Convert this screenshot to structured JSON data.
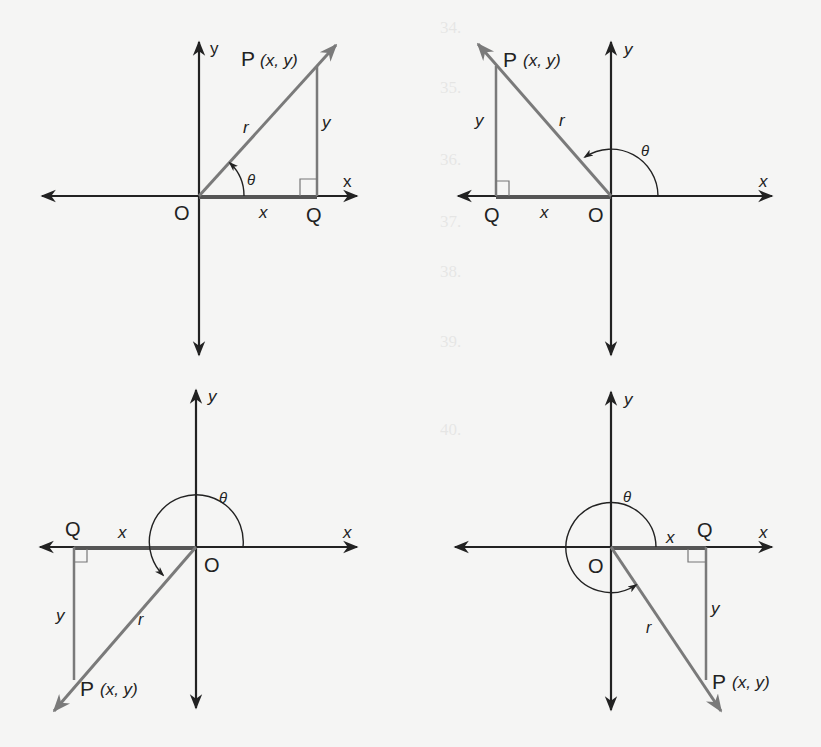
{
  "figure": {
    "colors": {
      "background": "#f5f5f4",
      "axis": "#222222",
      "ray": "#7a7a7a",
      "label": "#222222"
    },
    "panels": [
      {
        "id": "quadrant-1",
        "labels": {
          "point": "P",
          "point_coords": "(x, y)",
          "origin": "O",
          "foot": "Q",
          "x_axis": "x",
          "y_axis": "y",
          "x_seg": "x",
          "y_seg": "y",
          "radius": "r",
          "angle": "θ"
        }
      },
      {
        "id": "quadrant-2",
        "labels": {
          "point": "P",
          "point_coords": "(x, y)",
          "origin": "O",
          "foot": "Q",
          "x_axis": "x",
          "y_axis": "y",
          "x_seg": "x",
          "y_seg": "y",
          "radius": "r",
          "angle": "θ"
        }
      },
      {
        "id": "quadrant-3",
        "labels": {
          "point": "P",
          "point_coords": "(x, y)",
          "origin": "O",
          "foot": "Q",
          "x_axis": "x",
          "y_axis": "y",
          "x_seg": "x",
          "y_seg": "y",
          "radius": "r",
          "angle": "θ"
        }
      },
      {
        "id": "quadrant-4",
        "labels": {
          "point": "P",
          "point_coords": "(x, y)",
          "origin": "O",
          "foot": "Q",
          "x_axis": "x",
          "y_axis": "y",
          "x_seg": "x",
          "y_seg": "y",
          "radius": "r",
          "angle": "θ"
        }
      }
    ]
  },
  "bleed_through": {
    "lines": [
      "34.",
      "35.",
      "36.",
      "37.",
      "38.",
      "39.",
      "40."
    ]
  }
}
